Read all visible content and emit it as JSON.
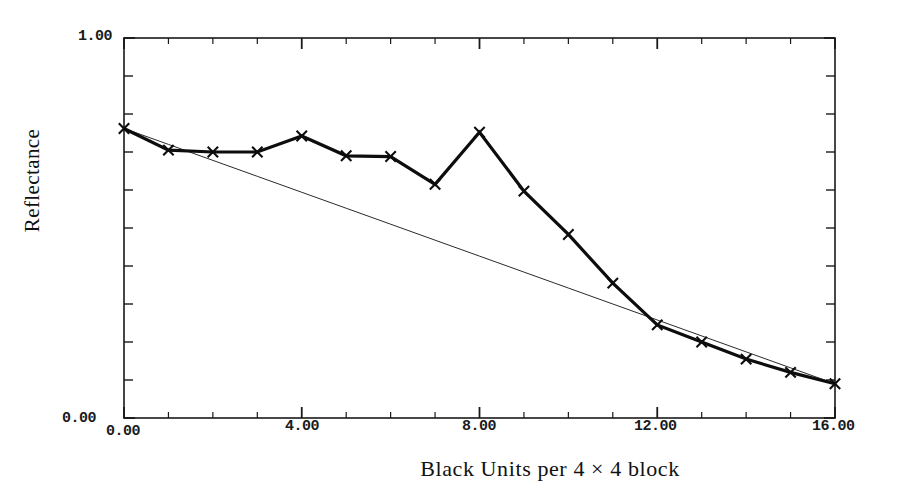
{
  "chart_data": {
    "type": "line",
    "title": "",
    "xlabel": "Black Units per 4 × 4 block",
    "ylabel": "Reflectance",
    "xlim": [
      0,
      16
    ],
    "ylim": [
      0.0,
      1.0
    ],
    "grid": false,
    "legend": null,
    "x_tick_labels": [
      "0.00",
      "4.00",
      "8.00",
      "12.00",
      "16.00"
    ],
    "x_tick_values": [
      0,
      4,
      8,
      12,
      16
    ],
    "y_tick_labels": [
      "0.00",
      "1.00"
    ],
    "y_tick_values": [
      0.0,
      1.0
    ],
    "x_minor_tick_step": 1,
    "y_minor_tick_step": 0.1,
    "x": [
      0,
      1,
      2,
      3,
      4,
      5,
      6,
      7,
      8,
      9,
      10,
      11,
      12,
      13,
      14,
      15,
      16
    ],
    "series": [
      {
        "name": "measured",
        "marker": "x",
        "line_width": 3.2,
        "values": [
          0.762,
          0.705,
          0.7,
          0.7,
          0.742,
          0.69,
          0.688,
          0.615,
          0.752,
          0.597,
          0.483,
          0.355,
          0.245,
          0.2,
          0.155,
          0.12,
          0.09
        ]
      },
      {
        "name": "linear-reference",
        "marker": "none",
        "line_width": 1.0,
        "values": [
          0.762,
          0.72,
          0.678,
          0.636,
          0.594,
          0.552,
          0.51,
          0.468,
          0.426,
          0.384,
          0.342,
          0.3,
          0.258,
          0.216,
          0.174,
          0.132,
          0.09
        ]
      }
    ]
  },
  "colors": {
    "background": "#ffffff",
    "axis": "#1a1a1a",
    "data_line": "#0d0d0d",
    "reference_line": "#2a2a2a",
    "text": "#111111"
  },
  "axes_labels": {
    "y_axis_title": "Reflectance",
    "x_axis_title": "Black Units per 4 × 4 block",
    "y_top_label": "1.00",
    "y_bottom_label": "0.00",
    "x_labels": [
      "0.00",
      "4.00",
      "8.00",
      "12.00",
      "16.00"
    ]
  }
}
